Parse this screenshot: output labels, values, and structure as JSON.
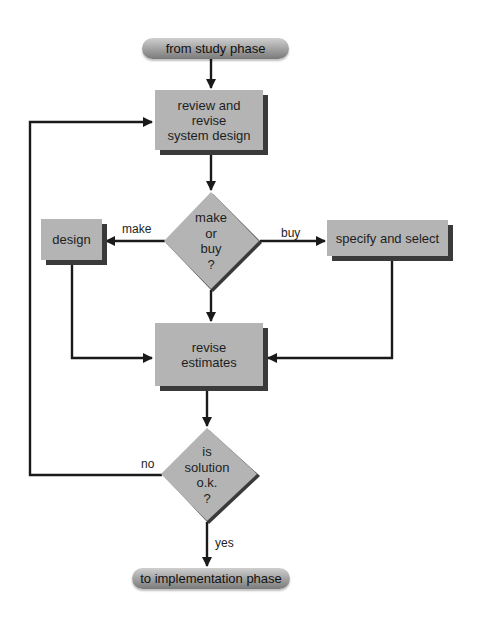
{
  "diagram": {
    "type": "flowchart",
    "colors": {
      "node_fill": "#b4b4b4",
      "node_shadow": "#3a3a3a",
      "line": "#1a1a1a",
      "terminal_gradient_top": "#cfcfcf",
      "terminal_gradient_bottom": "#7a7a7a"
    },
    "nodes": {
      "start": {
        "label": "from study phase",
        "shape": "terminal"
      },
      "review": {
        "label_lines": [
          "review and",
          "revise",
          "system design"
        ],
        "shape": "process"
      },
      "make_or_buy": {
        "label_lines": [
          "make",
          "or",
          "buy",
          "?"
        ],
        "shape": "decision"
      },
      "design": {
        "label": "design",
        "shape": "process"
      },
      "specify": {
        "label": "specify and select",
        "shape": "process"
      },
      "revise_estimates": {
        "label_lines": [
          "revise",
          "estimates"
        ],
        "shape": "process"
      },
      "solution_ok": {
        "label_lines": [
          "is",
          "solution",
          "o.k.",
          "?"
        ],
        "shape": "decision"
      },
      "end": {
        "label": "to implementation phase",
        "shape": "terminal"
      }
    },
    "edges": {
      "make": "make",
      "buy": "buy",
      "no": "no",
      "yes": "yes"
    }
  }
}
